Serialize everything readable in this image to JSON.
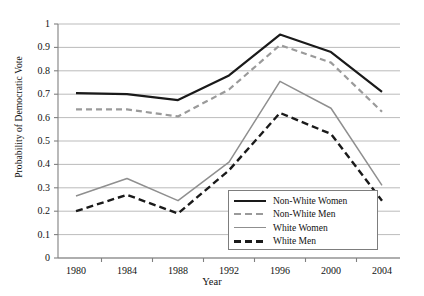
{
  "chart_data": {
    "type": "line",
    "title": "",
    "xlabel": "Year",
    "ylabel": "Probability of Democratic Vote",
    "categories": [
      "1980",
      "1984",
      "1988",
      "1992",
      "1996",
      "2000",
      "2004"
    ],
    "x": [
      1980,
      1984,
      1988,
      1992,
      1996,
      2000,
      2004
    ],
    "xlim": [
      1978,
      2006
    ],
    "ylim": [
      0,
      1
    ],
    "yticks": [
      "0",
      "0.1",
      "0.2",
      "0.3",
      "0.4",
      "0.5",
      "0.6",
      "0.7",
      "0.8",
      "0.9",
      "1"
    ],
    "grid": "horizontal",
    "legend_position": "inside-bottom-right",
    "series": [
      {
        "name": "Non-White Women",
        "color": "#1a1a1a",
        "style": "solid",
        "width": 2.2,
        "values": [
          0.705,
          0.7,
          0.675,
          0.78,
          0.955,
          0.88,
          0.71
        ]
      },
      {
        "name": "Non-White Men",
        "color": "#9a9a9a",
        "style": "dashed",
        "width": 2.2,
        "values": [
          0.635,
          0.635,
          0.605,
          0.72,
          0.91,
          0.835,
          0.625
        ]
      },
      {
        "name": "White Women",
        "color": "#8f8f8f",
        "style": "solid",
        "width": 1.5,
        "values": [
          0.265,
          0.34,
          0.245,
          0.41,
          0.755,
          0.64,
          0.31
        ]
      },
      {
        "name": "White Men",
        "color": "#1a1a1a",
        "style": "dashed",
        "width": 2.4,
        "values": [
          0.2,
          0.27,
          0.19,
          0.375,
          0.62,
          0.53,
          0.245
        ]
      }
    ]
  },
  "axes": {
    "y_title": "Probability of Democratic Vote",
    "x_title": "Year",
    "y_ticks": [
      "1",
      "0.9",
      "0.8",
      "0.7",
      "0.6",
      "0.5",
      "0.4",
      "0.3",
      "0.2",
      "0.1",
      "0"
    ],
    "x_ticks": [
      "1980",
      "1984",
      "1988",
      "1992",
      "1996",
      "2000",
      "2004"
    ]
  },
  "legend": {
    "items": [
      {
        "label": "Non-White Women",
        "color": "#1a1a1a",
        "style": "solid",
        "width": 2.2
      },
      {
        "label": "Non-White Men",
        "color": "#9a9a9a",
        "style": "dashed",
        "width": 2.2
      },
      {
        "label": "White Women",
        "color": "#8f8f8f",
        "style": "solid",
        "width": 1.5
      },
      {
        "label": "White Men",
        "color": "#1a1a1a",
        "style": "dashed",
        "width": 2.4
      }
    ]
  },
  "colors": {
    "grid": "#a9a9a9",
    "axis": "#808080",
    "background": "#ffffff",
    "text": "#111111"
  }
}
